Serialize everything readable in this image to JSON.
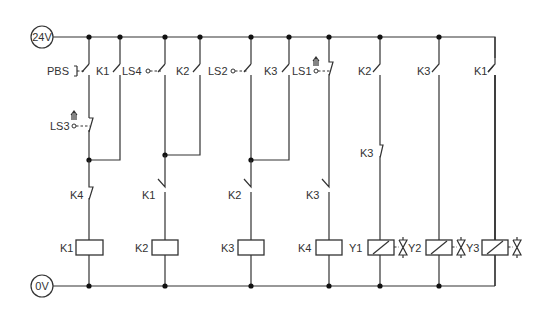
{
  "diagram": {
    "type": "electrical ladder diagram",
    "rails": {
      "top_label": "24V",
      "bottom_label": "0V"
    },
    "rungs": [
      {
        "branch_a": [
          {
            "label": "PBS",
            "kind": "pushbutton NO"
          },
          {
            "label": "LS3",
            "kind": "limit switch NC (actuated)"
          }
        ],
        "branch_b": [
          {
            "label": "K1",
            "kind": "NO contact (seal-in)"
          }
        ],
        "series": [
          {
            "label": "K4",
            "kind": "NC contact"
          }
        ],
        "output": {
          "label": "K1",
          "kind": "relay coil"
        }
      },
      {
        "branch_a": [
          {
            "label": "LS4",
            "kind": "limit switch NO"
          }
        ],
        "branch_b": [
          {
            "label": "K2",
            "kind": "NO contact (seal-in)"
          }
        ],
        "series": [
          {
            "label": "K1",
            "kind": "NO contact"
          }
        ],
        "output": {
          "label": "K2",
          "kind": "relay coil"
        }
      },
      {
        "branch_a": [
          {
            "label": "LS2",
            "kind": "limit switch NO"
          }
        ],
        "branch_b": [
          {
            "label": "K3",
            "kind": "NO contact (seal-in)"
          }
        ],
        "series": [
          {
            "label": "K2",
            "kind": "NO contact"
          }
        ],
        "output": {
          "label": "K3",
          "kind": "relay coil"
        }
      },
      {
        "branch_a": [
          {
            "label": "LS1",
            "kind": "limit switch NC (actuated)"
          }
        ],
        "series": [
          {
            "label": "K3",
            "kind": "NO contact"
          }
        ],
        "output": {
          "label": "K4",
          "kind": "relay coil"
        }
      },
      {
        "series": [
          {
            "label": "K2",
            "kind": "NO contact"
          },
          {
            "label": "K3",
            "kind": "NC contact"
          }
        ],
        "output": {
          "label": "Y1",
          "kind": "solenoid",
          "valve_label": "Y2"
        }
      },
      {
        "series": [
          {
            "label": "K3",
            "kind": "NO contact"
          }
        ],
        "output": {
          "label": "",
          "kind": "solenoid",
          "valve_label": "Y3"
        }
      },
      {
        "series": [
          {
            "label": "K1",
            "kind": "NO contact"
          }
        ],
        "output": {
          "label": "",
          "kind": "solenoid",
          "valve_label": ""
        }
      }
    ]
  },
  "labels": {
    "pbs": "PBS",
    "ls3": "LS3",
    "ls4": "LS4",
    "ls2": "LS2",
    "ls1": "LS1",
    "r1_seal": "K1",
    "r2_seal": "K2",
    "r3_seal": "K3",
    "r1_series": "K4",
    "r2_series": "K1",
    "r3_series": "K2",
    "r4_series": "K3",
    "r5_no": "K2",
    "r5_nc": "K3",
    "r6_no": "K3",
    "r7_no": "K1",
    "coil_k1": "K1",
    "coil_k2": "K2",
    "coil_k3": "K3",
    "coil_k4": "K4",
    "sol_y1": "Y1",
    "valve_y2": "Y2",
    "valve_y3": "Y3"
  },
  "colors": {
    "line": "#333333",
    "node": "#111111",
    "background": "#ffffff"
  }
}
